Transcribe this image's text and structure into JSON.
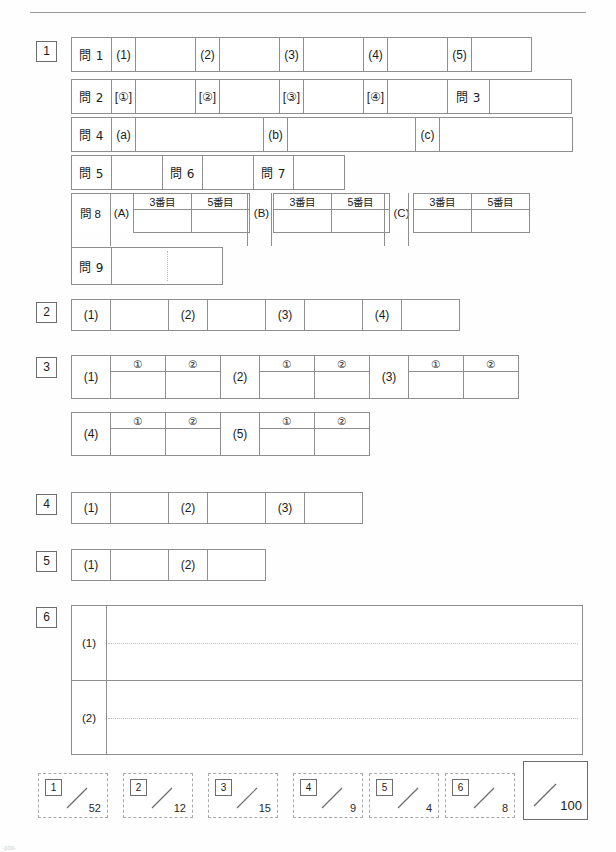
{
  "sheet": {
    "footnote": "-100-"
  },
  "sections": {
    "s1": {
      "num": "1",
      "rows": {
        "q1": {
          "label": "問 1",
          "items": [
            "(1)",
            "(2)",
            "(3)",
            "(4)",
            "(5)"
          ]
        },
        "q2": {
          "label": "問 2",
          "items": [
            "[①]",
            "[②]",
            "[③]",
            "[④]"
          ],
          "q3label": "問 3"
        },
        "q4": {
          "label": "問 4",
          "items": [
            "(a)",
            "(b)",
            "(c)"
          ]
        },
        "q567": {
          "q5": "問 5",
          "q6": "問 6",
          "q7": "問 7"
        },
        "q8": {
          "label": "問 8",
          "groups": [
            "(A)",
            "(B)",
            "(C)"
          ],
          "subheads": [
            "3番目",
            "5番目"
          ]
        },
        "q9": {
          "label": "問 9"
        }
      }
    },
    "s2": {
      "num": "2",
      "items": [
        "(1)",
        "(2)",
        "(3)",
        "(4)"
      ]
    },
    "s3": {
      "num": "3",
      "subheads": [
        "①",
        "②"
      ],
      "row1": [
        "(1)",
        "(2)",
        "(3)"
      ],
      "row2": [
        "(4)",
        "(5)"
      ]
    },
    "s4": {
      "num": "4",
      "items": [
        "(1)",
        "(2)",
        "(3)"
      ]
    },
    "s5": {
      "num": "5",
      "items": [
        "(1)",
        "(2)"
      ]
    },
    "s6": {
      "num": "6",
      "items": [
        "(1)",
        "(2)"
      ]
    }
  },
  "scoring": {
    "boxes": [
      {
        "num": "1",
        "max": "52"
      },
      {
        "num": "2",
        "max": "12"
      },
      {
        "num": "3",
        "max": "15"
      },
      {
        "num": "4",
        "max": "9"
      },
      {
        "num": "5",
        "max": "4"
      },
      {
        "num": "6",
        "max": "8"
      }
    ],
    "total_max": "100"
  }
}
